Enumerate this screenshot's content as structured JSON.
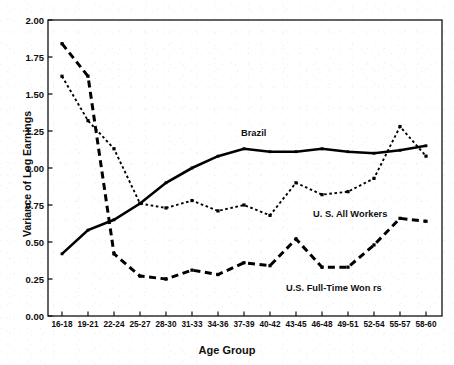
{
  "chart_data": {
    "type": "line",
    "title": "",
    "xlabel": "Age Group",
    "ylabel": "Variance of Log Earnings",
    "categories": [
      "16-18",
      "19-21",
      "22-24",
      "25-27",
      "28-30",
      "31-33",
      "34-36",
      "37-39",
      "40-42",
      "43-45",
      "46-48",
      "49-51",
      "52-54",
      "55-57",
      "58-60"
    ],
    "ylim": [
      0.0,
      2.0
    ],
    "ytick_labels": [
      "0.00",
      "0.25",
      "0.50",
      "0.75",
      "1.00",
      "1.25",
      "1.50",
      "1.75",
      "2.00"
    ],
    "ytick_values": [
      0.0,
      0.25,
      0.5,
      0.75,
      1.0,
      1.25,
      1.5,
      1.75,
      2.0
    ],
    "grid": false,
    "legend": "inline-annotations",
    "series": [
      {
        "name": "Brazil",
        "style": "solid",
        "color": "#000000",
        "values": [
          0.42,
          0.58,
          0.65,
          0.76,
          0.9,
          1.0,
          1.08,
          1.13,
          1.11,
          1.11,
          1.13,
          1.11,
          1.1,
          1.12,
          1.15
        ]
      },
      {
        "name": "U. S. All Workers",
        "style": "dotted",
        "color": "#000000",
        "values": [
          1.62,
          1.32,
          1.13,
          0.76,
          0.73,
          0.78,
          0.71,
          0.75,
          0.68,
          0.9,
          0.82,
          0.84,
          0.93,
          1.28,
          1.08
        ]
      },
      {
        "name": "U.S. Full-Time Workers",
        "style": "dashed",
        "color": "#000000",
        "values": [
          1.84,
          1.62,
          0.42,
          0.27,
          0.25,
          0.31,
          0.28,
          0.36,
          0.34,
          0.52,
          0.33,
          0.33,
          0.48,
          0.66,
          0.64
        ]
      }
    ],
    "annotations": [
      {
        "text": "Brazil",
        "series": "Brazil"
      },
      {
        "text": "U. S. All Workers",
        "series": "U. S. All Workers"
      },
      {
        "text": "U.S. Full-Time Won   rs",
        "series": "U.S. Full-Time Workers"
      }
    ]
  }
}
